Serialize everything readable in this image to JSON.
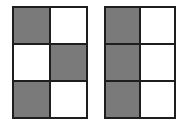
{
  "colors": {
    "shaded": "#7a7a7a",
    "unshaded": "#ffffff",
    "border": "#1e1e1e"
  },
  "grids": [
    {
      "name": "left-grid",
      "rows": 3,
      "cols": 2,
      "cells": [
        [
          true,
          false
        ],
        [
          false,
          true
        ],
        [
          true,
          false
        ]
      ],
      "shaded_count": 3
    },
    {
      "name": "right-grid",
      "rows": 3,
      "cols": 2,
      "cells": [
        [
          true,
          false
        ],
        [
          true,
          false
        ],
        [
          true,
          false
        ]
      ],
      "shaded_count": 3
    }
  ]
}
